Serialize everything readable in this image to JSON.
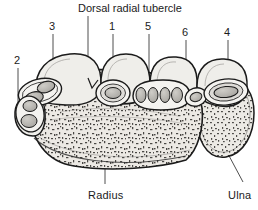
{
  "figure": {
    "kind": "anatomical-cross-section",
    "background_color": "#ffffff",
    "ink_color": "#1b1b1b",
    "bone_fill": "#e8e6e1",
    "tendon_fill": "#b9b7b2",
    "sheath_fill": "#f2f1ee"
  },
  "title": {
    "text": "Dorsal radial tubercle"
  },
  "labels": {
    "radius": "Radius",
    "ulna": "Ulna"
  },
  "compartments": [
    {
      "number": "1"
    },
    {
      "number": "2"
    },
    {
      "number": "3"
    },
    {
      "number": "4"
    },
    {
      "number": "5"
    },
    {
      "number": "6"
    }
  ]
}
